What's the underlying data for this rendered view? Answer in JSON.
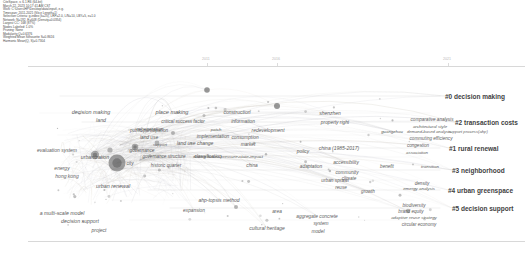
{
  "header": {
    "lines": [
      "CiteSpace, v. 6.1.R6 (64-bit)",
      "March 22, 2023 10:17:41 AM CST",
      "WoS: C:\\Users\\HP\\Desktop\\data\\input\\, e.g.",
      "Timespan: 2011-2021 (Slice Length=1)",
      "Selection Criteria: g-index (k=25), LRF=2.0, L/N=10, LBY=5, e=1.0",
      "Network: N=192, E=648 (Density=0.0354)",
      "Largest CC: 168 (87%)",
      "Nodes Labeled: 1.0%",
      "Pruning: None",
      "Modularity Q=0.6376",
      "Weighted Mean Silhouette S=0.8616",
      "Harmonic Mean(Q, S)=0.7304"
    ]
  },
  "timeline": {
    "years": [
      {
        "label": "2011",
        "x": 207
      },
      {
        "label": "2016",
        "x": 277
      },
      {
        "label": "2021",
        "x": 448
      }
    ]
  },
  "chart_data": {
    "type": "scatter",
    "xlabel": "",
    "ylabel": "",
    "clusters": [
      {
        "id": "#0",
        "label": "#0 decision making",
        "x": 445,
        "y": 96,
        "size": 15.5
      },
      {
        "id": "#2",
        "label": "#2 transaction costs",
        "x": 455,
        "y": 122,
        "size": 15.5
      },
      {
        "id": "#1",
        "label": "#1 rural renewal",
        "x": 449,
        "y": 148,
        "size": 15.5
      },
      {
        "id": "#3",
        "label": "#3 neighborhood",
        "x": 452,
        "y": 170,
        "size": 15.5
      },
      {
        "id": "#4",
        "label": "#4 urban greenspace",
        "x": 448,
        "y": 190,
        "size": 15.5
      },
      {
        "id": "#5",
        "label": "#5 decision support",
        "x": 452,
        "y": 208,
        "size": 15.5
      }
    ],
    "terms": [
      {
        "label": "decision making",
        "x": 91,
        "y": 112,
        "size": 5.4
      },
      {
        "label": "land",
        "x": 101,
        "y": 120,
        "size": 5.2
      },
      {
        "label": "place making",
        "x": 172,
        "y": 112,
        "size": 5.6
      },
      {
        "label": "critical success factor",
        "x": 183,
        "y": 121,
        "size": 4.6
      },
      {
        "label": "construction",
        "x": 237,
        "y": 112,
        "size": 5.0
      },
      {
        "label": "information",
        "x": 243,
        "y": 121,
        "size": 4.8
      },
      {
        "label": "shenzhen",
        "x": 330,
        "y": 113,
        "size": 5.0
      },
      {
        "label": "property right",
        "x": 335,
        "y": 122,
        "size": 4.8
      },
      {
        "label": "comparative analysis",
        "x": 432,
        "y": 119,
        "size": 4.6
      },
      {
        "label": "architectural style",
        "x": 430,
        "y": 126,
        "size": 4.4
      },
      {
        "label": "regeneration",
        "x": 150,
        "y": 129,
        "size": 4.8
      },
      {
        "label": "public participation",
        "x": 149,
        "y": 130,
        "size": 4.6
      },
      {
        "label": "patch",
        "x": 216,
        "y": 129,
        "size": 4.4
      },
      {
        "label": "redevelopment",
        "x": 268,
        "y": 130,
        "size": 5.0
      },
      {
        "label": "guangzhou",
        "x": 392,
        "y": 131,
        "size": 4.4
      },
      {
        "label": "demand-based analysis",
        "x": 429,
        "y": 131,
        "size": 4.2
      },
      {
        "label": "support process(ahp)",
        "x": 468,
        "y": 131,
        "size": 4.2
      },
      {
        "label": "land use",
        "x": 149,
        "y": 137,
        "size": 4.8
      },
      {
        "label": "implementation",
        "x": 213,
        "y": 136,
        "size": 4.8
      },
      {
        "label": "consumption",
        "x": 245,
        "y": 137,
        "size": 4.8
      },
      {
        "label": "commuting efficiency",
        "x": 431,
        "y": 138,
        "size": 4.6
      },
      {
        "label": "land use change",
        "x": 195,
        "y": 143,
        "size": 5.0
      },
      {
        "label": "market",
        "x": 248,
        "y": 144,
        "size": 4.8
      },
      {
        "label": "congestion",
        "x": 418,
        "y": 145,
        "size": 4.6
      },
      {
        "label": "support",
        "x": 160,
        "y": 144,
        "size": 4.2
      },
      {
        "label": "evaluation system",
        "x": 57,
        "y": 150,
        "size": 5.0
      },
      {
        "label": "governance",
        "x": 142,
        "y": 150,
        "size": 4.8
      },
      {
        "label": "policy",
        "x": 303,
        "y": 151,
        "size": 4.8
      },
      {
        "label": "association",
        "x": 417,
        "y": 152,
        "size": 4.4
      },
      {
        "label": "governance structure",
        "x": 164,
        "y": 156,
        "size": 4.6
      },
      {
        "label": "classification",
        "x": 208,
        "y": 156,
        "size": 4.8
      },
      {
        "label": "driving forces-pressure-state-impact",
        "x": 228,
        "y": 156,
        "size": 4.4
      },
      {
        "label": "urbanization",
        "x": 95,
        "y": 157,
        "size": 5.2
      },
      {
        "label": "china (1985-2017)",
        "x": 339,
        "y": 148,
        "size": 5.0
      },
      {
        "label": "historic quarter",
        "x": 166,
        "y": 165,
        "size": 4.6
      },
      {
        "label": "city",
        "x": 130,
        "y": 163,
        "size": 4.6
      },
      {
        "label": "china",
        "x": 252,
        "y": 165,
        "size": 4.8
      },
      {
        "label": "adaptation",
        "x": 311,
        "y": 166,
        "size": 4.8
      },
      {
        "label": "accessibility",
        "x": 346,
        "y": 162,
        "size": 4.8
      },
      {
        "label": "benefit",
        "x": 387,
        "y": 166,
        "size": 4.6
      },
      {
        "label": "transition",
        "x": 430,
        "y": 166,
        "size": 4.4
      },
      {
        "label": "energy",
        "x": 62,
        "y": 168,
        "size": 5.0
      },
      {
        "label": "community",
        "x": 347,
        "y": 172,
        "size": 4.8
      },
      {
        "label": "hong kong",
        "x": 67,
        "y": 176,
        "size": 5.0
      },
      {
        "label": "climate",
        "x": 349,
        "y": 178,
        "size": 4.6
      },
      {
        "label": "density",
        "x": 422,
        "y": 183,
        "size": 4.6
      },
      {
        "label": "emergy analysis",
        "x": 419,
        "y": 188,
        "size": 4.4
      },
      {
        "label": "urban renewal",
        "x": 113,
        "y": 186,
        "size": 5.4
      },
      {
        "label": "urban sprawl",
        "x": 335,
        "y": 180,
        "size": 4.8
      },
      {
        "label": "reuse",
        "x": 341,
        "y": 187,
        "size": 4.6
      },
      {
        "label": "growth",
        "x": 368,
        "y": 191,
        "size": 4.6
      },
      {
        "label": "biodiversity",
        "x": 414,
        "y": 205,
        "size": 4.6
      },
      {
        "label": "ahp-topsis method",
        "x": 219,
        "y": 200,
        "size": 5.0
      },
      {
        "label": "expansion",
        "x": 194,
        "y": 210,
        "size": 4.8
      },
      {
        "label": "area",
        "x": 277,
        "y": 211,
        "size": 4.8
      },
      {
        "label": "brand equity",
        "x": 411,
        "y": 211,
        "size": 4.6
      },
      {
        "label": "aggregate concrete",
        "x": 317,
        "y": 216,
        "size": 4.8
      },
      {
        "label": "adaptive reuse strategy",
        "x": 414,
        "y": 217,
        "size": 4.4
      },
      {
        "label": "system",
        "x": 321,
        "y": 223,
        "size": 4.8
      },
      {
        "label": "circular economy",
        "x": 419,
        "y": 224,
        "size": 4.6
      },
      {
        "label": "a multi-scale model",
        "x": 62,
        "y": 213,
        "size": 5.2
      },
      {
        "label": "decision support",
        "x": 80,
        "y": 221,
        "size": 5.2
      },
      {
        "label": "model",
        "x": 318,
        "y": 231,
        "size": 4.8
      },
      {
        "label": "cultural heritage",
        "x": 267,
        "y": 228,
        "size": 5.0
      },
      {
        "label": "project",
        "x": 99,
        "y": 230,
        "size": 5.0
      }
    ],
    "nodes": [
      {
        "x": 117,
        "y": 163,
        "r": 8.5,
        "color": "#7a7a7a"
      },
      {
        "x": 95,
        "y": 155,
        "r": 4.2,
        "color": "#8a8a8a"
      },
      {
        "x": 135,
        "y": 147,
        "r": 3.2,
        "color": "#8a8a8a"
      },
      {
        "x": 110,
        "y": 150,
        "r": 2.6,
        "color": "#9a9a9a"
      },
      {
        "x": 157,
        "y": 143,
        "r": 2.4,
        "color": "#9a9a9a"
      },
      {
        "x": 173,
        "y": 133,
        "r": 2.0,
        "color": "#9a9a9a"
      },
      {
        "x": 207,
        "y": 90,
        "r": 2.8,
        "color": "#6f6f6f"
      },
      {
        "x": 277,
        "y": 106,
        "r": 3.0,
        "color": "#6f6f6f"
      },
      {
        "x": 236,
        "y": 207,
        "r": 2.0,
        "color": "#9a9a9a"
      },
      {
        "x": 408,
        "y": 211,
        "r": 2.2,
        "color": "#9a9a9a"
      }
    ]
  }
}
